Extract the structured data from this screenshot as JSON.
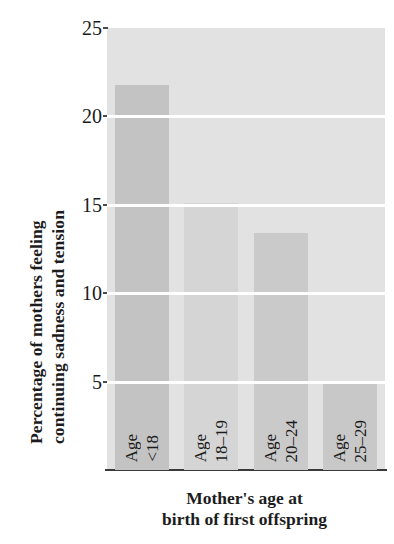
{
  "chart_data": {
    "type": "bar",
    "title": "",
    "subtitle": "",
    "xlabel": "Mother's age at birth of first offspring",
    "xlabel_line1": "Mother's age at",
    "xlabel_line2": "birth of first offspring",
    "ylabel": "Percentage of mothers feeling continuing sadness and tension",
    "ylabel_line1": "Percentage of mothers feeling",
    "ylabel_line2": "continuing sadness and tension",
    "categories": [
      "Age <18",
      "Age 18–19",
      "Age 20–24",
      "Age 25–29"
    ],
    "category_lines": [
      [
        "Age",
        "<18"
      ],
      [
        "Age",
        "18–19"
      ],
      [
        "Age",
        "20–24"
      ],
      [
        "Age",
        "25–29"
      ]
    ],
    "values": [
      21.8,
      15.1,
      13.4,
      5.0
    ],
    "ylim": [
      0,
      25
    ],
    "yticks": [
      25,
      20,
      15,
      10,
      5
    ],
    "ytick_labels": [
      "25",
      "20",
      "15",
      "10",
      "5"
    ],
    "gridlines": [
      20,
      15,
      10,
      5
    ],
    "grid": true,
    "grid_color": "#ffffff",
    "legend": null,
    "legend_position": "none",
    "plot_background": "#e2e2e2",
    "bar_colors": [
      "#c3c3c3",
      "#d5d5d5",
      "#cacaca",
      "#c8c8c8"
    ],
    "axis_color": "#3a3a3a",
    "text_color": "#1c1c1c"
  }
}
